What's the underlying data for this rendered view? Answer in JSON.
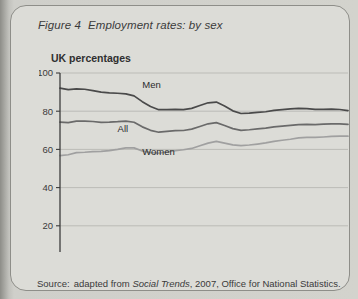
{
  "figure": {
    "number": "Figure 4",
    "title": "Employment rates: by sex",
    "source_label": "Source:",
    "source_text_1": "adapted from",
    "source_italic": "Social Trends",
    "source_text_2": ", 2007, Office for National Statistics."
  },
  "chart_data": {
    "type": "line",
    "title": "Employment rates: by sex",
    "subtitle": "UK percentages",
    "xlabel": "",
    "ylabel": "UK percentages",
    "ylim": [
      0,
      100
    ],
    "xlim": [
      1971,
      2006
    ],
    "yticks": [
      0,
      20,
      40,
      60,
      80,
      100
    ],
    "xticks": [
      1971,
      1976,
      1981,
      1986,
      1991,
      1996,
      2001,
      2006
    ],
    "grid": "horizontal",
    "legend": "inline-labels",
    "x": [
      1971,
      1972,
      1973,
      1974,
      1975,
      1976,
      1977,
      1978,
      1979,
      1980,
      1981,
      1982,
      1983,
      1984,
      1985,
      1986,
      1987,
      1988,
      1989,
      1990,
      1991,
      1992,
      1993,
      1994,
      1995,
      1996,
      1997,
      1998,
      1999,
      2000,
      2001,
      2002,
      2003,
      2004,
      2005,
      2006
    ],
    "series": [
      {
        "name": "Men",
        "color": "#4a4a4a",
        "label_x": 1981,
        "label_y": 92,
        "values": [
          92.1,
          91.3,
          91.7,
          91.5,
          90.8,
          90.0,
          89.6,
          89.4,
          89.1,
          88.0,
          85.0,
          82.5,
          80.8,
          80.8,
          81.0,
          80.8,
          81.5,
          83.0,
          84.4,
          84.8,
          82.7,
          80.2,
          78.8,
          79.0,
          79.4,
          79.7,
          80.4,
          80.8,
          81.2,
          81.5,
          81.4,
          81.0,
          81.0,
          81.1,
          80.9,
          80.3
        ]
      },
      {
        "name": "All",
        "color": "#6a6a6a",
        "label_x": 1978,
        "label_y": 69,
        "values": [
          74.3,
          74.0,
          74.8,
          74.8,
          74.6,
          74.2,
          74.3,
          74.5,
          74.8,
          74.2,
          71.8,
          70.0,
          69.0,
          69.4,
          69.8,
          69.9,
          70.6,
          72.0,
          73.4,
          74.0,
          72.5,
          70.9,
          70.0,
          70.3,
          70.7,
          71.1,
          71.8,
          72.2,
          72.6,
          73.0,
          73.1,
          73.0,
          73.2,
          73.4,
          73.4,
          73.1
        ]
      },
      {
        "name": "Women",
        "color": "#a0a0a0",
        "label_x": 1981,
        "label_y": 57,
        "values": [
          56.7,
          57.2,
          58.3,
          58.5,
          58.8,
          59.0,
          59.4,
          60.0,
          60.8,
          60.8,
          59.2,
          58.3,
          58.0,
          58.7,
          59.3,
          59.8,
          60.5,
          61.9,
          63.3,
          64.2,
          63.3,
          62.4,
          62.0,
          62.3,
          62.8,
          63.4,
          64.2,
          64.8,
          65.3,
          66.0,
          66.3,
          66.3,
          66.5,
          66.8,
          66.9,
          66.9
        ]
      }
    ]
  }
}
